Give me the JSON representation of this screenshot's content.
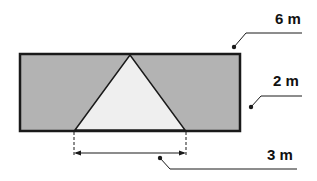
{
  "diagram": {
    "labels": {
      "width": "6 m",
      "height": "2 m",
      "base": "3 m"
    },
    "colors": {
      "rectangle_fill": "#b3b3b3",
      "triangle_fill": "#efefef",
      "stroke": "#1a1a1a"
    },
    "shapes": {
      "rectangle": {
        "description": "shaded rectangle 6 m by 2 m"
      },
      "triangle": {
        "description": "unshaded triangle with base 3 m and apex at top edge"
      }
    }
  }
}
